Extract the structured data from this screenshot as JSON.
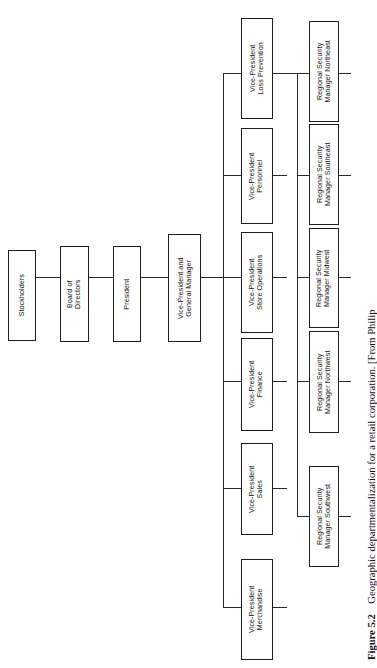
{
  "figure": {
    "number": "Figure 5.2",
    "caption": "Geographic departmentalization for a retail corporation. [From Philip",
    "orientation": "rotated-90-clockwise"
  },
  "colors": {
    "background": "#ffffff",
    "box_border": "#1c1c1c",
    "connector": "#2a2a2a",
    "text": "#111111"
  },
  "chain": {
    "stockholders": "Stockholders",
    "board": "Board of\nDirectors",
    "board_line1": "Board of",
    "board_line2": "Directors",
    "president": "President",
    "vp_gm_line1": "Vice-President and",
    "vp_gm_line2": "General Manager"
  },
  "vice_presidents": [
    {
      "line1": "Vice-President",
      "line2": "Loss Prevention"
    },
    {
      "line1": "Vice-President",
      "line2": "Personnel"
    },
    {
      "line1": "Vice-President",
      "line2": "Store Operations"
    },
    {
      "line1": "Vice-President",
      "line2": "Finance"
    },
    {
      "line1": "Vice-President",
      "line2": "Sales"
    },
    {
      "line1": "Vice-President",
      "line2": "Merchandise"
    }
  ],
  "regional_security_managers": [
    {
      "line1": "Regional Security",
      "line2": "Manager Northeast"
    },
    {
      "line1": "Regional Security",
      "line2": "Manager Southeast"
    },
    {
      "line1": "Regional Security",
      "line2": "Manager Midwest"
    },
    {
      "line1": "Regional Security",
      "line2": "Manager Northwest"
    },
    {
      "line1": "Regional Security",
      "line2": "Manager Southwest"
    }
  ]
}
